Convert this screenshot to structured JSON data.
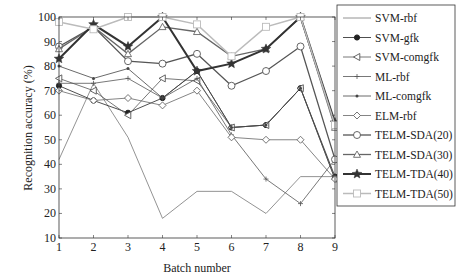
{
  "chart_data": {
    "type": "line",
    "title": "",
    "xlabel": "Batch number",
    "ylabel": "Recognition accuracy (%)",
    "x": [
      1,
      2,
      3,
      4,
      5,
      6,
      7,
      8,
      9
    ],
    "xlim": [
      1,
      9
    ],
    "ylim": [
      10,
      100
    ],
    "yticks": [
      10,
      20,
      30,
      40,
      50,
      60,
      70,
      80,
      90,
      100
    ],
    "grid": false,
    "legend_position": "upper right, outside plot",
    "series": [
      {
        "name": "SVM-rbf",
        "marker": "none",
        "color": "#777777",
        "width": 0.8,
        "values": [
          42,
          73,
          51,
          18,
          29,
          29,
          20,
          35,
          35
        ]
      },
      {
        "name": "SVM-gfk",
        "marker": "dot",
        "color": "#222222",
        "width": 0.8,
        "values": [
          72,
          66,
          61,
          67,
          78,
          55,
          56,
          71,
          35
        ]
      },
      {
        "name": "SVM-comgfk",
        "marker": "triangle-left",
        "color": "#555555",
        "width": 0.8,
        "values": [
          75,
          70,
          60,
          75,
          74,
          55,
          56,
          71,
          34
        ]
      },
      {
        "name": "ML-rbf",
        "marker": "plus",
        "color": "#555555",
        "width": 0.8,
        "values": [
          73,
          73,
          75,
          67,
          75,
          52,
          34,
          24,
          42
        ]
      },
      {
        "name": "ML-comgfk",
        "marker": "small-star",
        "color": "#444444",
        "width": 0.8,
        "values": [
          80,
          75,
          79,
          67,
          78,
          55,
          56,
          71,
          34
        ]
      },
      {
        "name": "ELM-rbf",
        "marker": "diamond",
        "color": "#666666",
        "width": 0.8,
        "values": [
          70,
          66,
          67,
          64,
          70,
          51,
          50,
          50,
          34
        ]
      },
      {
        "name": "TELM-SDA(20)",
        "marker": "circle",
        "color": "#555555",
        "width": 1.3,
        "values": [
          88,
          96,
          82,
          81,
          85,
          72,
          78,
          88,
          42
        ]
      },
      {
        "name": "TELM-SDA(30)",
        "marker": "triangle-up",
        "color": "#666666",
        "width": 1.3,
        "values": [
          87,
          96,
          85,
          96,
          94,
          84,
          87,
          100,
          55
        ]
      },
      {
        "name": "TELM-TDA(40)",
        "marker": "star",
        "color": "#333333",
        "width": 2.0,
        "values": [
          83,
          97,
          88,
          100,
          78,
          81,
          87,
          100,
          57
        ]
      },
      {
        "name": "TELM-TDA(50)",
        "marker": "square",
        "color": "#bbbbbb",
        "width": 1.5,
        "values": [
          98,
          95,
          100,
          100,
          97,
          84,
          96,
          100,
          56
        ]
      }
    ]
  }
}
